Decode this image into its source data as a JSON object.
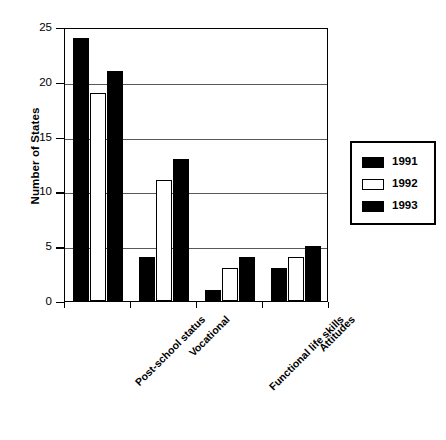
{
  "chart_data": {
    "type": "bar",
    "title": "",
    "xlabel": "",
    "ylabel": "Number of States",
    "categories": [
      "Post-school status",
      "Vocational",
      "Functional life skills",
      "Attitudes"
    ],
    "series": [
      {
        "name": "1991",
        "values": [
          24,
          4,
          1,
          3
        ],
        "color": "#000000",
        "style": "filled"
      },
      {
        "name": "1992",
        "values": [
          19,
          11,
          3,
          4
        ],
        "color": "#ffffff",
        "style": "hollow"
      },
      {
        "name": "1993",
        "values": [
          21,
          13,
          4,
          5
        ],
        "color": "#000000",
        "style": "filled"
      }
    ],
    "ylim": [
      0,
      25
    ],
    "yticks": [
      0,
      5,
      10,
      15,
      20,
      25
    ],
    "ytick_labels": [
      "0",
      "5",
      "10",
      "15",
      "20",
      "25"
    ],
    "grid": true,
    "grid_axis": "y",
    "legend_position": "right",
    "legend_entries": [
      "1991",
      "1992",
      "1993"
    ],
    "xtick_label_rotation": -45
  }
}
